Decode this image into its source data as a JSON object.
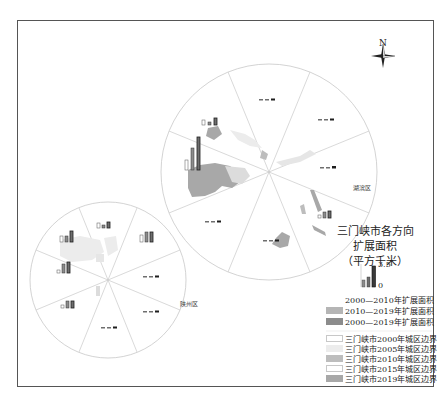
{
  "map": {
    "north_arrow_label": "N",
    "district_labels": {
      "hubin": "湖滨区",
      "shanzhou": "陕州区"
    },
    "big_circle": {
      "cx": 269,
      "cy": 172,
      "r": 108,
      "sectors": 8
    },
    "small_circle": {
      "cx": 108,
      "cy": 280,
      "r": 78,
      "sectors": 8
    }
  },
  "legend": {
    "title_lines": [
      "三门峡市各方向",
      "扩展面积",
      "（平方千米）"
    ],
    "scale": {
      "max": "3.5",
      "min": "0"
    },
    "bar_series": [
      {
        "label": "2000—2010年扩展面积",
        "color": "#ffffff",
        "border": "#ffffff"
      },
      {
        "label": "2010—2019年扩展面积",
        "color": "#b5b5b5",
        "border": "#b5b5b5"
      },
      {
        "label": "2000—2019年扩展面积",
        "color": "#8c8c8c",
        "border": "#8c8c8c"
      }
    ],
    "boundaries": [
      {
        "label": "三门峡市2000年城区边界",
        "color": "#ffffff",
        "border": "#c8c8c8"
      },
      {
        "label": "三门峡市2005年城区边界",
        "color": "#ececec",
        "border": "#ececec"
      },
      {
        "label": "三门峡市2010年城区边界",
        "color": "#bdbdbd",
        "border": "#bdbdbd"
      },
      {
        "label": "三门峡市2015年城区边界",
        "color": "#ffffff",
        "border": "#c8c8c8"
      },
      {
        "label": "三门峡市2019年城区边界",
        "color": "#a8a8a8",
        "border": "#a8a8a8"
      }
    ]
  },
  "colors": {
    "frame": "#555555",
    "circle_line": "#c8c8c8",
    "bar_dark": "#1e1e1e",
    "bar_mid": "#6e6e6e",
    "urban_dark": "#a8a8a8",
    "urban_light": "#dcdcdc"
  }
}
